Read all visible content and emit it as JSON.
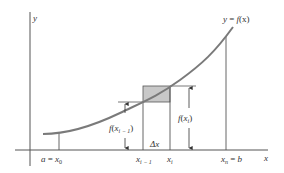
{
  "diagram": {
    "type": "riemann-sum-illustration",
    "axes": {
      "x_label": "x",
      "y_label": "y"
    },
    "curve": {
      "label": "y = f(x)",
      "label_parts": {
        "y": "y",
        "eq": " = ",
        "f": "f",
        "arg": "(x)"
      }
    },
    "ticks": {
      "x0": {
        "label_a": "a",
        "eq": " = ",
        "x": "x",
        "sub": "0"
      },
      "xim1": {
        "x": "x",
        "sub": "i − 1"
      },
      "xi": {
        "x": "x",
        "sub": "i"
      },
      "xn": {
        "x": "x",
        "sub": "n",
        "eq": " = ",
        "b": "b"
      }
    },
    "annotations": {
      "f_xim1": {
        "f": "f",
        "open": "(",
        "x": "x",
        "sub": "i − 1",
        "close": ")"
      },
      "f_xi": {
        "f": "f",
        "open": "(",
        "x": "x",
        "sub": "i",
        "close": ")"
      },
      "delta_x": "Δx"
    },
    "colors": {
      "curve": "#7a7a7a",
      "axes": "#444444",
      "shaded": "#c8c8c8",
      "lines": "#555555"
    }
  }
}
